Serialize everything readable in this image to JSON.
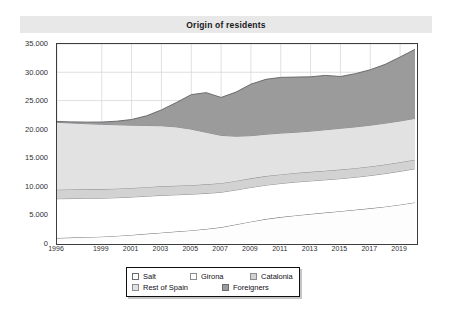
{
  "chart_data": {
    "type": "area",
    "stacked": true,
    "title": "Origin of residents",
    "xlabel": "",
    "ylabel": "",
    "ylim": [
      0,
      35000
    ],
    "ytick_labels": [
      "0",
      "5.000",
      "10.000",
      "15.000",
      "20.000",
      "25.000",
      "30.000",
      "35.000"
    ],
    "ytick_values": [
      0,
      5000,
      10000,
      15000,
      20000,
      25000,
      30000,
      35000
    ],
    "xtick_labels": [
      "1996",
      "1999",
      "2001",
      "2003",
      "2005",
      "2007",
      "2009",
      "2011",
      "2013",
      "2015",
      "2017",
      "2019"
    ],
    "xtick_values": [
      1996,
      1999,
      2001,
      2003,
      2005,
      2007,
      2009,
      2011,
      2013,
      2015,
      2017,
      2019
    ],
    "x": [
      1996,
      1997,
      1998,
      1999,
      2000,
      2001,
      2002,
      2003,
      2004,
      2005,
      2006,
      2007,
      2008,
      2009,
      2010,
      2011,
      2012,
      2013,
      2014,
      2015,
      2016,
      2017,
      2018,
      2019,
      2020
    ],
    "grid": true,
    "legend_position": "bottom",
    "series": [
      {
        "name": "Salt",
        "color": "#fdfdfd",
        "line_color": "#6b6b70",
        "values": [
          700,
          780,
          860,
          950,
          1080,
          1250,
          1450,
          1650,
          1850,
          2050,
          2300,
          2600,
          3100,
          3600,
          4050,
          4400,
          4700,
          4950,
          5200,
          5450,
          5700,
          5950,
          6250,
          6600,
          7000
        ]
      },
      {
        "name": "Girona",
        "color": "#ffffff",
        "line_color": "#8c8c90",
        "values": [
          6950,
          6900,
          6850,
          6800,
          6750,
          6700,
          6650,
          6600,
          6500,
          6400,
          6300,
          6200,
          6100,
          6050,
          6000,
          5950,
          5900,
          5850,
          5800,
          5750,
          5750,
          5800,
          5850,
          5900,
          5950
        ]
      },
      {
        "name": "Catalonia",
        "color": "#d2d2d2",
        "line_color": "#8c8c90",
        "values": [
          1600,
          1600,
          1600,
          1600,
          1600,
          1600,
          1600,
          1600,
          1600,
          1600,
          1600,
          1600,
          1600,
          1600,
          1600,
          1600,
          1600,
          1600,
          1600,
          1600,
          1600,
          1600,
          1600,
          1600,
          1600
        ]
      },
      {
        "name": "Rest of Spain",
        "color": "#e2e2e2",
        "line_color": "#8c8c90",
        "values": [
          11900,
          11750,
          11600,
          11450,
          11300,
          11100,
          10900,
          10700,
          10400,
          9900,
          9200,
          8450,
          7900,
          7550,
          7400,
          7300,
          7200,
          7200,
          7250,
          7300,
          7300,
          7300,
          7300,
          7300,
          7300
        ]
      },
      {
        "name": "Foreigners",
        "color": "#9b9b9b",
        "line_color": "#6b6b70",
        "values": [
          150,
          200,
          280,
          400,
          620,
          1000,
          1700,
          2800,
          4300,
          6100,
          7000,
          6700,
          7800,
          9100,
          9700,
          9850,
          9750,
          9600,
          9600,
          9150,
          9400,
          9800,
          10400,
          11300,
          12200
        ]
      }
    ]
  },
  "legend": {
    "rows": [
      [
        {
          "label": "Salt",
          "series": "Salt"
        },
        {
          "label": "Girona",
          "series": "Girona"
        },
        {
          "label": "Catalonia",
          "series": "Catalonia"
        }
      ],
      [
        {
          "label": "Rest of Spain",
          "series": "Rest of Spain"
        },
        {
          "label": "Foreigners",
          "series": "Foreigners"
        }
      ]
    ]
  }
}
